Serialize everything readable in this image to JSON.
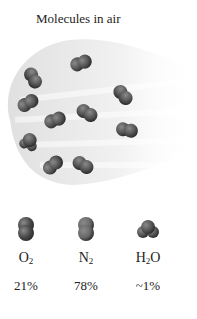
{
  "title": "Molecules in air",
  "molecules_in_plume": [
    {
      "type": "O2",
      "x": 33,
      "y": 78,
      "angle": 60
    },
    {
      "type": "N2",
      "x": 81,
      "y": 63,
      "angle": -20
    },
    {
      "type": "N2",
      "x": 123,
      "y": 95,
      "angle": 50
    },
    {
      "type": "O2",
      "x": 28,
      "y": 103,
      "angle": -30
    },
    {
      "type": "N2",
      "x": 87,
      "y": 113,
      "angle": 30
    },
    {
      "type": "N2",
      "x": 55,
      "y": 120,
      "angle": -20
    },
    {
      "type": "N2",
      "x": 127,
      "y": 130,
      "angle": 10
    },
    {
      "type": "H2O",
      "x": 29,
      "y": 142,
      "angle": 20
    },
    {
      "type": "O2",
      "x": 53,
      "y": 165,
      "angle": -40
    },
    {
      "type": "N2",
      "x": 83,
      "y": 165,
      "angle": 30
    }
  ],
  "legend": [
    {
      "name": "O2",
      "base": "O",
      "sub": "2",
      "suffix": "",
      "percent": "21%",
      "color": "#4a4a4a"
    },
    {
      "name": "N2",
      "base": "N",
      "sub": "2",
      "suffix": "",
      "percent": "78%",
      "color": "#6a6a6a"
    },
    {
      "name": "H2O",
      "base": "H",
      "sub": "2",
      "suffix": "O",
      "percent": "~1%",
      "color": "#555555"
    }
  ]
}
